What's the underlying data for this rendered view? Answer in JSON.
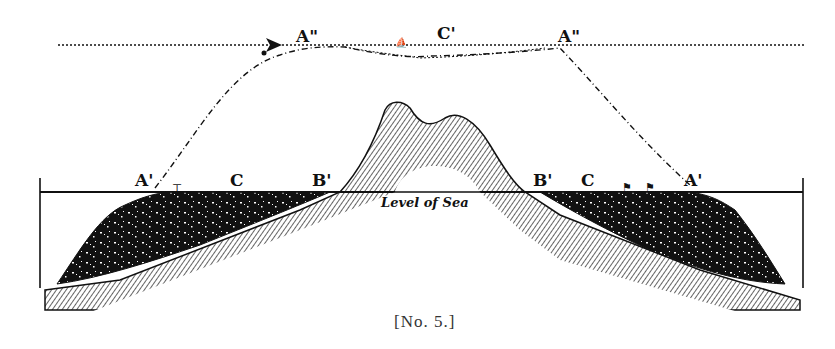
{
  "figure": {
    "caption": "[No. 5.]",
    "sea_label": "Level of Sea",
    "labels": {
      "top_left": "A\"",
      "top_center": "C'",
      "top_right": "A\"",
      "left_a": "A'",
      "left_c": "C",
      "left_b": "B'",
      "right_b": "B'",
      "right_c": "C",
      "right_a": "A'"
    },
    "colors": {
      "ink": "#111111",
      "paper": "#ffffff",
      "caption": "#333333"
    }
  }
}
